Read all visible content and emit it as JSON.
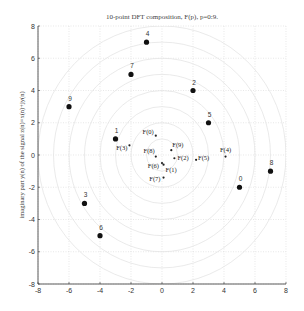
{
  "chart_data": {
    "type": "scatter",
    "title": "10-point DFT composition, F(p), p=0:9.",
    "xlabel": "",
    "ylabel": "imaginary part y(n) of the signal z(n)=x(n)+jy(n)",
    "xlim": [
      -8,
      8
    ],
    "ylim": [
      -8,
      8
    ],
    "xticks": [
      -8,
      -6,
      -4,
      -2,
      0,
      2,
      4,
      6,
      8
    ],
    "yticks": [
      -8,
      -6,
      -4,
      -2,
      0,
      2,
      4,
      6,
      8
    ],
    "grid": true,
    "legend": null,
    "series": [
      {
        "name": "signal z(n)",
        "marker": "large-dot",
        "points": [
          {
            "label": "0",
            "x": 5,
            "y": -2
          },
          {
            "label": "1",
            "x": -3,
            "y": 1
          },
          {
            "label": "2",
            "x": 2,
            "y": 4
          },
          {
            "label": "3",
            "x": -5,
            "y": -3
          },
          {
            "label": "4",
            "x": -1,
            "y": 7
          },
          {
            "label": "5",
            "x": 3,
            "y": 2
          },
          {
            "label": "6",
            "x": -4,
            "y": -5
          },
          {
            "label": "7",
            "x": -2,
            "y": 5
          },
          {
            "label": "8",
            "x": 7,
            "y": -1
          },
          {
            "label": "9",
            "x": -6,
            "y": 3
          }
        ]
      },
      {
        "name": "DFT F(p)",
        "marker": "small-dot",
        "points": [
          {
            "label": "F(0)",
            "x": -0.4,
            "y": 1.2
          },
          {
            "label": "F(1)",
            "x": 0.1,
            "y": -0.6
          },
          {
            "label": "F(2)",
            "x": 0.8,
            "y": -0.2
          },
          {
            "label": "F(3)",
            "x": -2.1,
            "y": 0.6
          },
          {
            "label": "F(4)",
            "x": 4.1,
            "y": -0.1
          },
          {
            "label": "F(5)",
            "x": 2.2,
            "y": -0.3
          },
          {
            "label": "F(6)",
            "x": 0.0,
            "y": -0.5
          },
          {
            "label": "F(7)",
            "x": 0.1,
            "y": -1.4
          },
          {
            "label": "F(8)",
            "x": -0.4,
            "y": -0.1
          },
          {
            "label": "F(9)",
            "x": 0.6,
            "y": 0.3
          }
        ]
      }
    ],
    "background_circles": {
      "center": [
        0,
        0
      ],
      "radii": [
        1,
        2,
        3,
        4,
        5,
        6,
        7,
        8
      ],
      "color": "#e4e4e4"
    }
  }
}
